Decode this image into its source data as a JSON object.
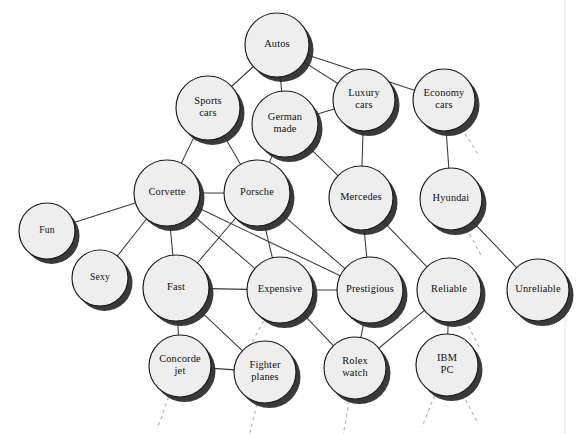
{
  "diagram": {
    "background_color": "#ffffff",
    "node_fill": "#eeeeee",
    "node_stroke": "#1a1a1a",
    "shadow_color": "#2b2b2b",
    "edge_color": "#3a3a3a",
    "stub_color": "#b8b8b8",
    "width": 583,
    "height": 434
  },
  "nodes": [
    {
      "id": "autos",
      "label": "Autos",
      "lines": [
        "Autos"
      ],
      "x": 277,
      "y": 45,
      "r": 32
    },
    {
      "id": "sports_cars",
      "label": "Sports cars",
      "lines": [
        "Sports",
        "cars"
      ],
      "x": 208,
      "y": 108,
      "r": 32
    },
    {
      "id": "german_made",
      "label": "German made",
      "lines": [
        "German",
        "made"
      ],
      "x": 285,
      "y": 124,
      "r": 33
    },
    {
      "id": "luxury_cars",
      "label": "Luxury cars",
      "lines": [
        "Luxury",
        "cars"
      ],
      "x": 364,
      "y": 100,
      "r": 31
    },
    {
      "id": "economy_cars",
      "label": "Economy cars",
      "lines": [
        "Economy",
        "cars"
      ],
      "x": 444,
      "y": 100,
      "r": 31
    },
    {
      "id": "corvette",
      "label": "Corvette",
      "lines": [
        "Corvette"
      ],
      "x": 167,
      "y": 193,
      "r": 33
    },
    {
      "id": "porsche",
      "label": "Porsche",
      "lines": [
        "Porsche"
      ],
      "x": 257,
      "y": 193,
      "r": 33
    },
    {
      "id": "mercedes",
      "label": "Mercedes",
      "lines": [
        "Mercedes"
      ],
      "x": 361,
      "y": 198,
      "r": 32
    },
    {
      "id": "hyundai",
      "label": "Hyundai",
      "lines": [
        "Hyundai"
      ],
      "x": 451,
      "y": 199,
      "r": 31
    },
    {
      "id": "fun",
      "label": "Fun",
      "lines": [
        "Fun"
      ],
      "x": 47,
      "y": 231,
      "r": 28
    },
    {
      "id": "sexy",
      "label": "Sexy",
      "lines": [
        "Sexy"
      ],
      "x": 100,
      "y": 278,
      "r": 28
    },
    {
      "id": "fast",
      "label": "Fast",
      "lines": [
        "Fast"
      ],
      "x": 176,
      "y": 288,
      "r": 33
    },
    {
      "id": "expensive",
      "label": "Expensive",
      "lines": [
        "Expensive"
      ],
      "x": 280,
      "y": 290,
      "r": 33
    },
    {
      "id": "prestigious",
      "label": "Prestigious",
      "lines": [
        "Prestigious"
      ],
      "x": 370,
      "y": 290,
      "r": 33
    },
    {
      "id": "reliable",
      "label": "Reliable",
      "lines": [
        "Reliable"
      ],
      "x": 449,
      "y": 290,
      "r": 32
    },
    {
      "id": "unreliable",
      "label": "Unreliable",
      "lines": [
        "Unreliable"
      ],
      "x": 538,
      "y": 290,
      "r": 31
    },
    {
      "id": "concorde_jet",
      "label": "Concorde jet",
      "lines": [
        "Concorde",
        "jet"
      ],
      "x": 180,
      "y": 366,
      "r": 31
    },
    {
      "id": "fighter_planes",
      "label": "Fighter planes",
      "lines": [
        "Fighter",
        "planes"
      ],
      "x": 265,
      "y": 372,
      "r": 31
    },
    {
      "id": "rolex_watch",
      "label": "Rolex watch",
      "lines": [
        "Rolex",
        "watch"
      ],
      "x": 355,
      "y": 368,
      "r": 31
    },
    {
      "id": "ibm_pc",
      "label": "IBM PC",
      "lines": [
        "IBM",
        "PC"
      ],
      "x": 447,
      "y": 365,
      "r": 31
    }
  ],
  "edges": [
    {
      "from": "autos",
      "to": "sports_cars"
    },
    {
      "from": "autos",
      "to": "german_made"
    },
    {
      "from": "autos",
      "to": "luxury_cars"
    },
    {
      "from": "autos",
      "to": "economy_cars"
    },
    {
      "from": "sports_cars",
      "to": "corvette"
    },
    {
      "from": "sports_cars",
      "to": "porsche"
    },
    {
      "from": "german_made",
      "to": "luxury_cars"
    },
    {
      "from": "german_made",
      "to": "porsche"
    },
    {
      "from": "german_made",
      "to": "mercedes"
    },
    {
      "from": "luxury_cars",
      "to": "mercedes"
    },
    {
      "from": "economy_cars",
      "to": "hyundai"
    },
    {
      "from": "corvette",
      "to": "porsche"
    },
    {
      "from": "corvette",
      "to": "fun"
    },
    {
      "from": "corvette",
      "to": "sexy"
    },
    {
      "from": "corvette",
      "to": "fast"
    },
    {
      "from": "corvette",
      "to": "expensive"
    },
    {
      "from": "corvette",
      "to": "prestigious"
    },
    {
      "from": "porsche",
      "to": "fast"
    },
    {
      "from": "porsche",
      "to": "expensive"
    },
    {
      "from": "porsche",
      "to": "prestigious"
    },
    {
      "from": "mercedes",
      "to": "prestigious"
    },
    {
      "from": "mercedes",
      "to": "reliable"
    },
    {
      "from": "hyundai",
      "to": "unreliable"
    },
    {
      "from": "fast",
      "to": "expensive"
    },
    {
      "from": "fast",
      "to": "concorde_jet"
    },
    {
      "from": "fast",
      "to": "fighter_planes"
    },
    {
      "from": "expensive",
      "to": "prestigious"
    },
    {
      "from": "expensive",
      "to": "rolex_watch"
    },
    {
      "from": "prestigious",
      "to": "rolex_watch"
    },
    {
      "from": "reliable",
      "to": "rolex_watch"
    },
    {
      "from": "reliable",
      "to": "ibm_pc"
    },
    {
      "from": "concorde_jet",
      "to": "fighter_planes"
    }
  ],
  "stubs": [
    {
      "from": "economy_cars",
      "angle": 58,
      "length": 30
    },
    {
      "from": "hyundai",
      "angle": 62,
      "length": 32
    },
    {
      "from": "expensive",
      "angle": 118,
      "length": 30
    },
    {
      "from": "reliable",
      "angle": 62,
      "length": 32
    },
    {
      "from": "concorde_jet",
      "angle": 110,
      "length": 34
    },
    {
      "from": "fighter_planes",
      "angle": 104,
      "length": 32
    },
    {
      "from": "rolex_watch",
      "angle": 100,
      "length": 34
    },
    {
      "from": "ibm_pc",
      "angle": 112,
      "length": 34
    },
    {
      "from": "ibm_pc",
      "angle": 62,
      "length": 34
    }
  ],
  "frame": {
    "right_border_x": 565,
    "visible": true
  }
}
